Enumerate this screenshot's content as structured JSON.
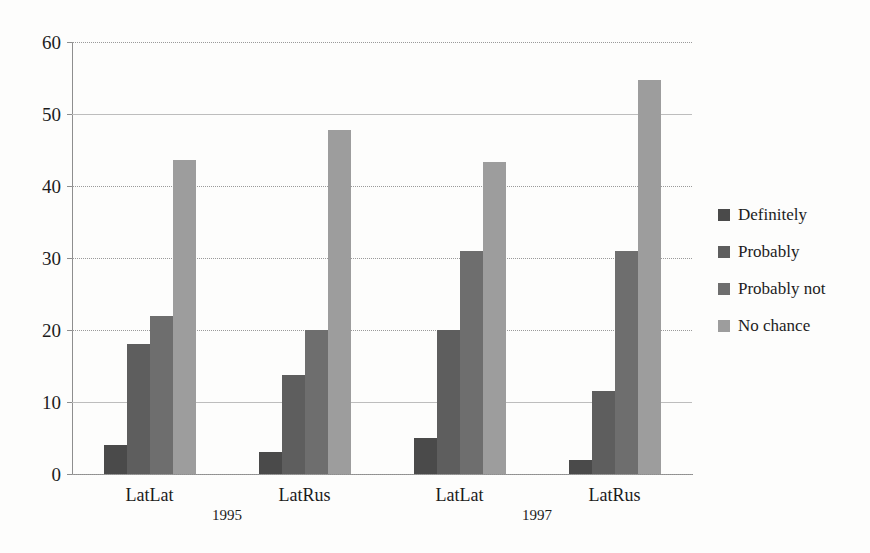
{
  "chart_data": {
    "type": "bar",
    "title": "",
    "subtitle": "",
    "xlabel": "",
    "ylabel": "",
    "ylim": [
      0,
      60
    ],
    "yticks": [
      0,
      10,
      20,
      30,
      40,
      50,
      60
    ],
    "ytick_labels": [
      "0",
      "10",
      "20",
      "30",
      "40",
      "50",
      "60"
    ],
    "grid": true,
    "legend_position": "right",
    "categories": [
      "LatLat",
      "LatRus",
      "LatLat",
      "LatRus"
    ],
    "group_labels": [
      "1995",
      "1997"
    ],
    "groups": [
      {
        "period": "1995",
        "category": "LatLat"
      },
      {
        "period": "1995",
        "category": "LatRus"
      },
      {
        "period": "1997",
        "category": "LatLat"
      },
      {
        "period": "1997",
        "category": "LatRus"
      }
    ],
    "series": [
      {
        "name": "Definitely",
        "color": "#4a4a4a",
        "values": [
          4,
          3,
          5,
          2
        ]
      },
      {
        "name": "Probably",
        "color": "#5e5e5e",
        "values": [
          18,
          13.7,
          20,
          11.5
        ]
      },
      {
        "name": "Probably not",
        "color": "#6e6e6e",
        "values": [
          22,
          20,
          31,
          31
        ]
      },
      {
        "name": "No chance",
        "color": "#9d9d9d",
        "values": [
          43.6,
          47.8,
          43.4,
          54.7
        ]
      }
    ],
    "legend": [
      "Definitely",
      "Probably",
      "Probably not",
      "No chance"
    ]
  }
}
